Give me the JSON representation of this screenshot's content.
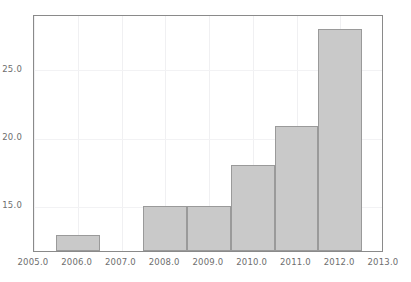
{
  "chart_data": {
    "type": "bar",
    "title": "",
    "subtitle": "",
    "xlabel": "",
    "ylabel": "",
    "xlim": [
      2005.0,
      2013.0
    ],
    "ylim": [
      11.6,
      29.0
    ],
    "grid": true,
    "legend": null,
    "bar_align": "centered-on-year",
    "bar_width_years": 1.0,
    "categories": [
      2006,
      2008,
      2009,
      2010,
      2011,
      2012
    ],
    "values": [
      12.8,
      14.9,
      14.9,
      17.9,
      20.8,
      27.9
    ],
    "bars": [
      {
        "x": 2006,
        "value": 12.8
      },
      {
        "x": 2008,
        "value": 14.9
      },
      {
        "x": 2009,
        "value": 14.9
      },
      {
        "x": 2010,
        "value": 17.9
      },
      {
        "x": 2011,
        "value": 20.8
      },
      {
        "x": 2012,
        "value": 27.9
      }
    ],
    "xticks": [
      {
        "value": 2005.0,
        "label": "2005.0"
      },
      {
        "value": 2006.0,
        "label": "2006.0"
      },
      {
        "value": 2007.0,
        "label": "2007.0"
      },
      {
        "value": 2008.0,
        "label": "2008.0"
      },
      {
        "value": 2009.0,
        "label": "2009.0"
      },
      {
        "value": 2010.0,
        "label": "2010.0"
      },
      {
        "value": 2011.0,
        "label": "2011.0"
      },
      {
        "value": 2012.0,
        "label": "2012.0"
      },
      {
        "value": 2013.0,
        "label": "2013.0"
      }
    ],
    "yticks": [
      {
        "value": 15.0,
        "label": "15.0"
      },
      {
        "value": 20.0,
        "label": "20.0"
      },
      {
        "value": 25.0,
        "label": "25.0"
      }
    ],
    "colors": {
      "bar_fill": "#c9c9c9",
      "bar_edge": "#9a9a9a",
      "axis": "#8a8a8a",
      "grid": "#f0f0f2",
      "tick_text": "#6e6e6e",
      "background": "#ffffff"
    }
  }
}
